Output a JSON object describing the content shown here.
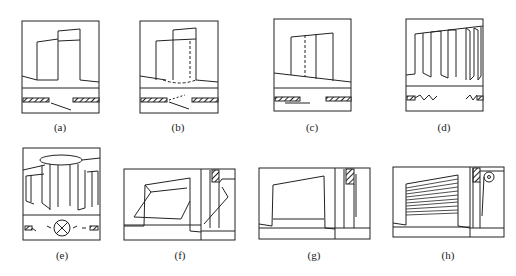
{
  "figure": {
    "panels": [
      {
        "id": "a",
        "label": "(a)",
        "type": "single-swing-door"
      },
      {
        "id": "b",
        "label": "(b)",
        "type": "double-swing-door"
      },
      {
        "id": "c",
        "label": "(c)",
        "type": "sliding-door"
      },
      {
        "id": "d",
        "label": "(d)",
        "type": "folding-door"
      },
      {
        "id": "e",
        "label": "(e)",
        "type": "revolving-door"
      },
      {
        "id": "f",
        "label": "(f)",
        "type": "up-and-over-door"
      },
      {
        "id": "g",
        "label": "(g)",
        "type": "lifting-door"
      },
      {
        "id": "h",
        "label": "(h)",
        "type": "rolling-shutter-door"
      }
    ]
  },
  "colors": {
    "line": "#222222",
    "background": "#ffffff"
  }
}
